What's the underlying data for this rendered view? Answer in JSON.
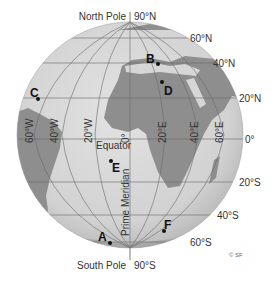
{
  "poles": {
    "north": "North Pole",
    "north_lat": "90°N",
    "south": "South Pole",
    "south_lat": "90°S"
  },
  "latitude_labels": [
    {
      "label": "60°N",
      "lat": 60
    },
    {
      "label": "40°N",
      "lat": 40
    },
    {
      "label": "20°N",
      "lat": 20
    },
    {
      "label": "0°",
      "lat": 0
    },
    {
      "label": "20°S",
      "lat": -20
    },
    {
      "label": "40°S",
      "lat": -40
    },
    {
      "label": "60°S",
      "lat": -60
    }
  ],
  "longitude_labels": [
    {
      "label": "60°W",
      "lon": -60
    },
    {
      "label": "40°W",
      "lon": -40
    },
    {
      "label": "20°W",
      "lon": -20
    },
    {
      "label": "0°",
      "lon": 0
    },
    {
      "label": "20°E",
      "lon": 20
    },
    {
      "label": "40°E",
      "lon": 40
    },
    {
      "label": "60°E",
      "lon": 60
    }
  ],
  "line_labels": {
    "equator": "Equator",
    "prime_meridian": "Prime Meridian"
  },
  "points": [
    {
      "id": "A",
      "label": "A"
    },
    {
      "id": "B",
      "label": "B"
    },
    {
      "id": "C",
      "label": "C"
    },
    {
      "id": "D",
      "label": "D"
    },
    {
      "id": "E",
      "label": "E"
    },
    {
      "id": "F",
      "label": "F"
    }
  ],
  "copyright": "© SF",
  "colors": {
    "ocean": "#d4d4d4",
    "land": "#8e8e8e",
    "grid": "#6a6a6a",
    "text": "#333333",
    "point": "#111111"
  }
}
